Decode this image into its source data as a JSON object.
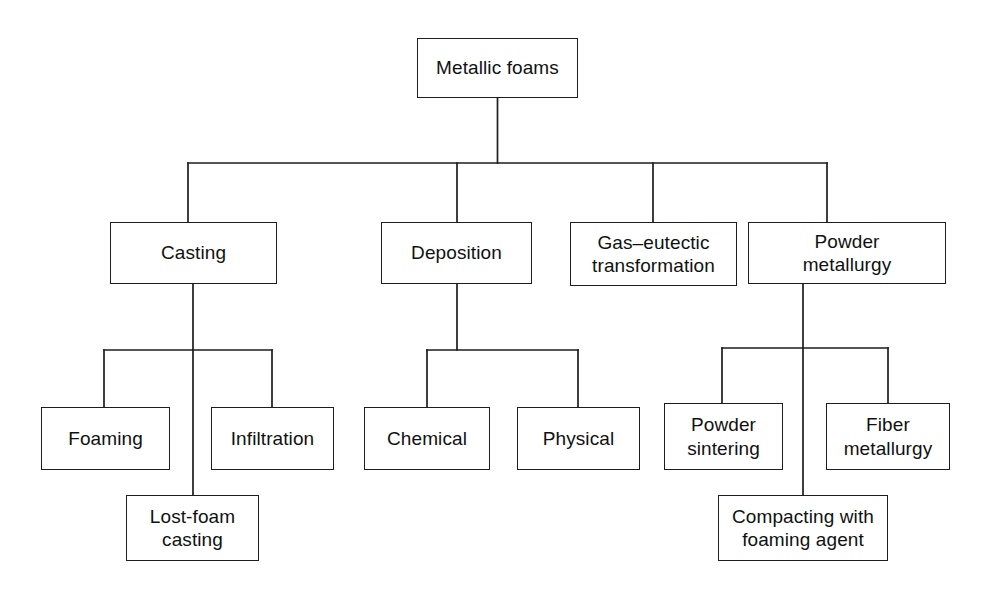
{
  "diagram": {
    "type": "hierarchy-tree",
    "orientation": "top-down",
    "line_color": "#1d1d1d",
    "box_fill": "#ffffff",
    "text_color": "#111111",
    "levels": 3,
    "nodes": [
      {
        "id": "metallic-foams",
        "label": "Metallic foams",
        "level": 0,
        "x": 417,
        "y": 38,
        "w": 161,
        "h": 60,
        "parent": null
      },
      {
        "id": "casting",
        "label": "Casting",
        "level": 1,
        "x": 110,
        "y": 222,
        "w": 167,
        "h": 62,
        "parent": "metallic-foams"
      },
      {
        "id": "deposition",
        "label": "Deposition",
        "level": 1,
        "x": 381,
        "y": 222,
        "w": 151,
        "h": 62,
        "parent": "metallic-foams"
      },
      {
        "id": "gas-eutectic-transformation",
        "label": "Gas–eutectic\ntransformation",
        "level": 1,
        "x": 570,
        "y": 222,
        "w": 167,
        "h": 64,
        "parent": "metallic-foams"
      },
      {
        "id": "powder-metallurgy",
        "label": "Powder\nmetallurgy",
        "level": 1,
        "x": 748,
        "y": 222,
        "w": 198,
        "h": 62,
        "parent": "metallic-foams"
      },
      {
        "id": "foaming",
        "label": "Foaming",
        "level": 2,
        "x": 41,
        "y": 407,
        "w": 129,
        "h": 63,
        "parent": "casting"
      },
      {
        "id": "infiltration",
        "label": "Infiltration",
        "level": 2,
        "x": 211,
        "y": 407,
        "w": 123,
        "h": 63,
        "parent": "casting"
      },
      {
        "id": "lost-foam-casting",
        "label": "Lost-foam\ncasting",
        "level": 2,
        "x": 126,
        "y": 495,
        "w": 133,
        "h": 66,
        "parent": "casting"
      },
      {
        "id": "chemical",
        "label": "Chemical",
        "level": 2,
        "x": 364,
        "y": 407,
        "w": 126,
        "h": 63,
        "parent": "deposition"
      },
      {
        "id": "physical",
        "label": "Physical",
        "level": 2,
        "x": 517,
        "y": 407,
        "w": 123,
        "h": 63,
        "parent": "deposition"
      },
      {
        "id": "powder-sintering",
        "label": "Powder\nsintering",
        "level": 2,
        "x": 664,
        "y": 403,
        "w": 119,
        "h": 67,
        "parent": "powder-metallurgy"
      },
      {
        "id": "fiber-metallurgy",
        "label": "Fiber\nmetallurgy",
        "level": 2,
        "x": 826,
        "y": 403,
        "w": 124,
        "h": 67,
        "parent": "powder-metallurgy"
      },
      {
        "id": "compacting-with-foaming-agent",
        "label": "Compacting with\nfoaming agent",
        "level": 2,
        "x": 718,
        "y": 495,
        "w": 170,
        "h": 66,
        "parent": "powder-metallurgy"
      }
    ],
    "connectors": [
      {
        "id": "root-stem",
        "d": "M 497.5 98 L 497.5 163"
      },
      {
        "id": "level1-bus",
        "d": "M 188 163 L 827 163"
      },
      {
        "id": "drop-casting",
        "d": "M 188 163 L 188 222"
      },
      {
        "id": "drop-deposition",
        "d": "M 457 163 L 457 222"
      },
      {
        "id": "drop-gas-eutectic",
        "d": "M 653 163 L 653 222"
      },
      {
        "id": "drop-powder-metallurgy",
        "d": "M 827 163 L 827 222"
      },
      {
        "id": "casting-stem",
        "d": "M 193 284 L 193 495"
      },
      {
        "id": "casting-bus",
        "d": "M 104 350 L 272 350"
      },
      {
        "id": "drop-foaming",
        "d": "M 104 350 L 104 407"
      },
      {
        "id": "drop-infiltration",
        "d": "M 272 350 L 272 407"
      },
      {
        "id": "deposition-stem",
        "d": "M 457 284 L 457 350"
      },
      {
        "id": "deposition-bus",
        "d": "M 427 350 L 578 350"
      },
      {
        "id": "drop-chemical",
        "d": "M 427 350 L 427 407"
      },
      {
        "id": "drop-physical",
        "d": "M 578 350 L 578 407"
      },
      {
        "id": "pm-stem",
        "d": "M 803 284 L 803 495"
      },
      {
        "id": "pm-bus",
        "d": "M 722 348 L 888 348"
      },
      {
        "id": "drop-powder-sintering",
        "d": "M 722 348 L 722 403"
      },
      {
        "id": "drop-fiber-metallurgy",
        "d": "M 888 348 L 888 403"
      }
    ]
  }
}
